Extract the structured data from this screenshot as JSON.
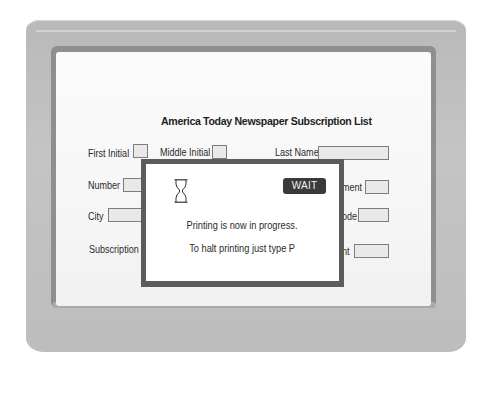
{
  "form": {
    "title": "America Today Newspaper Subscription List",
    "fields": {
      "first_initial": {
        "label": "First Initial",
        "value": ""
      },
      "middle_initial": {
        "label": "Middle Initial",
        "value": ""
      },
      "last_name": {
        "label": "Last Name",
        "value": ""
      },
      "number": {
        "label": "Number",
        "value": ""
      },
      "apartment_partial": {
        "label": "ment",
        "value": ""
      },
      "city": {
        "label": "City",
        "value": ""
      },
      "zip_code_partial": {
        "label": "ode",
        "value": ""
      },
      "subscription_partial": {
        "label": "Subscription L",
        "value": ""
      },
      "amount_partial": {
        "label": "nt",
        "value": ""
      }
    }
  },
  "dialog": {
    "icon": "hourglass-icon",
    "badge": "WAIT",
    "message": "Printing is now in progress.",
    "instruction": "To halt printing just type P"
  },
  "colors": {
    "bezel": "#bdbdbd",
    "screen": "#f8f8f8",
    "dialog_border": "#5c5c5c",
    "badge_bg": "#3a3a3a"
  }
}
